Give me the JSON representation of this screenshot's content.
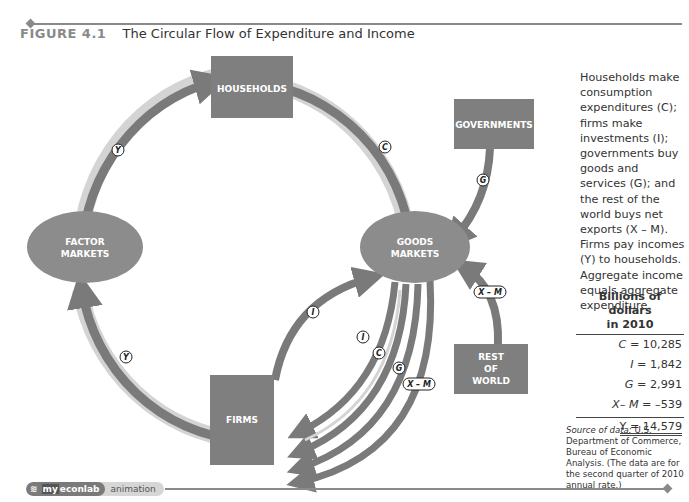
{
  "figure": {
    "number": "FIGURE 4.1",
    "title": "The Circular Flow of Expenditure and Income"
  },
  "diagram": {
    "nodes": {
      "households": "HOUSEHOLDS",
      "governments": "GOVERNMENTS",
      "factor_markets_line1": "FACTOR",
      "factor_markets_line2": "MARKETS",
      "goods_markets_line1": "GOODS",
      "goods_markets_line2": "MARKETS",
      "firms": "FIRMS",
      "rest_line1": "REST",
      "rest_line2": "OF",
      "rest_line3": "WORLD"
    },
    "flow_labels": {
      "y_top": "Y",
      "c_top": "C",
      "g_gov": "G",
      "y_bottom": "Y",
      "i_outer": "I",
      "i_inner": "I",
      "c_inner": "C",
      "g_inner": "G",
      "xm_inner": "X – M",
      "xm_rest": "X – M"
    },
    "colors": {
      "box": "#7f7f7f",
      "ellipse": "#8c8c8c",
      "arrow_dark": "#7a7a7a",
      "arrow_halo": "#d4d4d4"
    }
  },
  "caption": "Households make consumption expenditures (C); firms make investments (I); governments buy goods and services (G); and the rest of the world buys net exports (X – M). Firms pay incomes (Y) to households. Aggregate income equals aggregate expenditure.",
  "table": {
    "title_line1": "Billions of dollars",
    "title_line2": "in 2010",
    "rows": [
      {
        "lhs": "C",
        "eq": " = ",
        "value": "10,285"
      },
      {
        "lhs": "I",
        "eq": " =   ",
        "value": "1,842"
      },
      {
        "lhs": "G",
        "eq": " =   ",
        "value": "2,991"
      },
      {
        "lhs": "X– M",
        "eq": " =     ",
        "value": "–539"
      }
    ],
    "total": "Y = 14,579"
  },
  "source": {
    "label": "Source of data:",
    "text": " U.S. Department of Commerce, Bureau of Economic Analysis. (The data are for the second quarter of 2010 annual rate.)"
  },
  "footer": {
    "brand_prefix": "my",
    "brand_suffix": "econlab",
    "tag": "animation"
  }
}
